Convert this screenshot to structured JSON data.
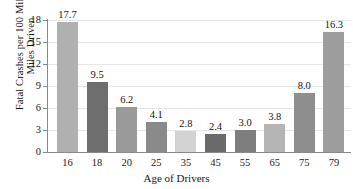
{
  "chart_data": {
    "type": "bar",
    "title": "",
    "xlabel": "Age of Drivers",
    "ylabel_lines": [
      "Fatal Crashes per 100 Million",
      "Miles Driven"
    ],
    "ylabel": "Fatal Crashes per 100 Million Miles Driven",
    "categories": [
      "16",
      "18",
      "20",
      "25",
      "35",
      "45",
      "55",
      "65",
      "75",
      "79"
    ],
    "values": [
      17.7,
      9.5,
      6.2,
      4.1,
      2.8,
      2.4,
      3.0,
      3.8,
      8.0,
      16.3
    ],
    "value_labels": [
      "17.7",
      "9.5",
      "6.2",
      "4.1",
      "2.8",
      "2.4",
      "3.0",
      "3.8",
      "8.0",
      "16.3"
    ],
    "bar_colors": [
      "#b0b0b0",
      "#6e6e6e",
      "#9a9a9a",
      "#8a8a8a",
      "#d2d2d2",
      "#6a6a6a",
      "#7d7d7d",
      "#b4b4b4",
      "#8e8e8e",
      "#9d9d9d"
    ],
    "ylim": [
      0,
      18
    ],
    "yticks": [
      0,
      3,
      6,
      9,
      12,
      15,
      18
    ],
    "ytick_labels": [
      "0",
      "3",
      "6",
      "9",
      "12",
      "15",
      "18"
    ],
    "grid": true,
    "grid_color": "#e6e6e6",
    "axis_color": "#8a8a8a",
    "legend": null,
    "background": "#ffffff"
  }
}
